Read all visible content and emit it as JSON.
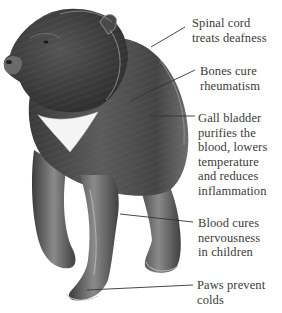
{
  "figure": {
    "colors": {
      "fur_dark": "#2e2e2e",
      "fur_mid": "#5a5a5a",
      "fur_light": "#9a9a9a",
      "chest_patch": "#f4f4f4",
      "leader_line": "#333333",
      "label_text": "#3a3a3a",
      "background": "#ffffff"
    },
    "annotations": [
      {
        "id": "spinal-cord",
        "text": "Spinal cord\ntreats deafness"
      },
      {
        "id": "bones",
        "text": "Bones cure\nrheumatism"
      },
      {
        "id": "gall-bladder",
        "text": "Gall bladder\npurifies the\nblood, lowers\ntemperature\nand reduces\ninflammation"
      },
      {
        "id": "blood",
        "text": "Blood cures\nnervousness\nin children"
      },
      {
        "id": "paws",
        "text": "Paws prevent\ncolds"
      }
    ]
  }
}
